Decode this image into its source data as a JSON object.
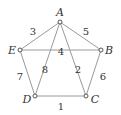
{
  "diagram": {
    "type": "weighted-graph",
    "nodes": [
      {
        "id": "A",
        "label": "A",
        "x": 60,
        "y": 22
      },
      {
        "id": "B",
        "label": "B",
        "x": 101,
        "y": 50
      },
      {
        "id": "C",
        "label": "C",
        "x": 86,
        "y": 96
      },
      {
        "id": "D",
        "label": "D",
        "x": 35,
        "y": 96
      },
      {
        "id": "E",
        "label": "E",
        "x": 20,
        "y": 50
      }
    ],
    "edges": [
      {
        "from": "A",
        "to": "E",
        "weight": "3"
      },
      {
        "from": "A",
        "to": "B",
        "weight": "5"
      },
      {
        "from": "E",
        "to": "B",
        "weight": "4"
      },
      {
        "from": "A",
        "to": "D",
        "weight": "8"
      },
      {
        "from": "A",
        "to": "C",
        "weight": "2"
      },
      {
        "from": "E",
        "to": "D",
        "weight": "7"
      },
      {
        "from": "B",
        "to": "C",
        "weight": "6"
      },
      {
        "from": "D",
        "to": "C",
        "weight": "1"
      }
    ]
  }
}
